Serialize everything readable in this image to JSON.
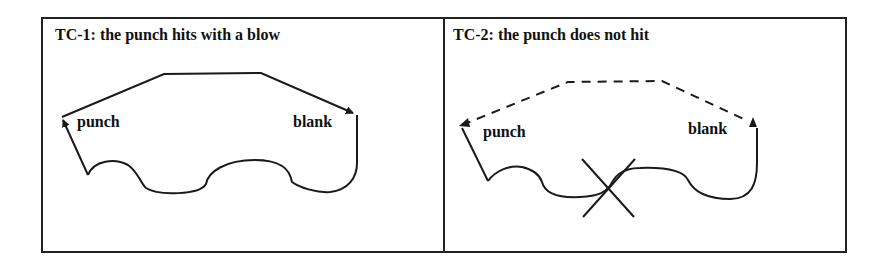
{
  "figure": {
    "panels": [
      {
        "id": "tc1",
        "title": "TC-1: the punch hits with a blow",
        "labels": {
          "punch": "punch",
          "blank": "blank"
        },
        "top_path_style": "solid",
        "crossed": false
      },
      {
        "id": "tc2",
        "title": "TC-2: the punch does not hit",
        "labels": {
          "punch": "punch",
          "blank": "blank"
        },
        "top_path_style": "dashed",
        "crossed": true
      }
    ],
    "colors": {
      "line": "#1a1a1a",
      "border": "#222222",
      "background": "#ffffff"
    }
  }
}
